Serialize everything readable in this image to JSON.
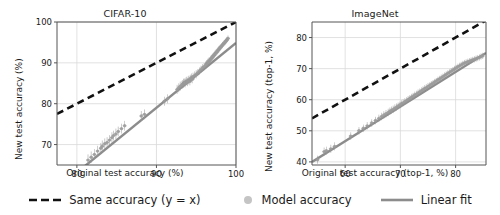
{
  "figure": {
    "background": "#ffffff",
    "scatter_color": "#9a9a9a",
    "fit_color": "#8c8c8c",
    "identity_color": "#111111",
    "grid_color": "#d9d9d9",
    "axis_color": "#555555"
  },
  "legend": {
    "items": [
      {
        "label": "Same accuracy (y = x)",
        "marker": "dashed-line-swatch",
        "color": "#111111"
      },
      {
        "label": "Model accuracy",
        "marker": "circle-marker-swatch",
        "color": "#bdbdbd"
      },
      {
        "label": "Linear fit",
        "marker": "solid-line-swatch",
        "color": "#8c8c8c"
      }
    ]
  },
  "chart_data": [
    {
      "type": "scatter",
      "title": "CIFAR-10",
      "xlabel": "Original test accuracy (%)",
      "ylabel": "New test accuracy (%)",
      "xlim": [
        77.5,
        100.0
      ],
      "ylim": [
        65.0,
        100.0
      ],
      "xticks": [
        80,
        90,
        100
      ],
      "yticks": [
        70,
        80,
        90,
        100
      ],
      "grid": true,
      "legend_position": "figure-bottom",
      "identity_line": {
        "label": "Same accuracy (y = x)",
        "slope": 1,
        "intercept": 0,
        "style": "dashed"
      },
      "linear_fit": {
        "label": "Linear fit",
        "slope": 1.588,
        "intercept": -63.9,
        "style": "solid"
      },
      "points": [
        {
          "x": 81.4,
          "y": 66.2,
          "yerr": 1.4
        },
        {
          "x": 81.8,
          "y": 66.9,
          "yerr": 1.4
        },
        {
          "x": 82.2,
          "y": 67.6,
          "yerr": 1.3
        },
        {
          "x": 82.6,
          "y": 68.4,
          "yerr": 1.3
        },
        {
          "x": 83.0,
          "y": 69.1,
          "yerr": 1.3
        },
        {
          "x": 83.2,
          "y": 69.6,
          "yerr": 1.4
        },
        {
          "x": 83.5,
          "y": 70.2,
          "yerr": 1.3
        },
        {
          "x": 83.8,
          "y": 70.5,
          "yerr": 1.3
        },
        {
          "x": 84.1,
          "y": 71.1,
          "yerr": 1.2
        },
        {
          "x": 84.4,
          "y": 71.7,
          "yerr": 1.3
        },
        {
          "x": 84.6,
          "y": 72.2,
          "yerr": 1.2
        },
        {
          "x": 84.9,
          "y": 72.6,
          "yerr": 1.3
        },
        {
          "x": 85.2,
          "y": 73.2,
          "yerr": 1.2
        },
        {
          "x": 85.6,
          "y": 73.9,
          "yerr": 1.2
        },
        {
          "x": 86.0,
          "y": 74.6,
          "yerr": 1.2
        },
        {
          "x": 88.1,
          "y": 77.0,
          "yerr": 1.2
        },
        {
          "x": 88.5,
          "y": 77.4,
          "yerr": 1.2
        },
        {
          "x": 91.0,
          "y": 80.6,
          "yerr": 1.1
        },
        {
          "x": 91.4,
          "y": 81.2,
          "yerr": 1.1
        },
        {
          "x": 92.6,
          "y": 83.5,
          "yerr": 1.1
        },
        {
          "x": 92.8,
          "y": 83.9,
          "yerr": 1.1
        },
        {
          "x": 93.0,
          "y": 84.3,
          "yerr": 1.1
        },
        {
          "x": 93.2,
          "y": 84.6,
          "yerr": 1.0
        },
        {
          "x": 93.3,
          "y": 84.8,
          "yerr": 1.0
        },
        {
          "x": 93.4,
          "y": 85.0,
          "yerr": 1.1
        },
        {
          "x": 93.5,
          "y": 85.2,
          "yerr": 1.0
        },
        {
          "x": 93.6,
          "y": 85.0,
          "yerr": 1.0
        },
        {
          "x": 93.7,
          "y": 85.4,
          "yerr": 1.0
        },
        {
          "x": 93.8,
          "y": 85.6,
          "yerr": 1.0
        },
        {
          "x": 93.9,
          "y": 85.3,
          "yerr": 1.0
        },
        {
          "x": 94.0,
          "y": 85.7,
          "yerr": 1.0
        },
        {
          "x": 94.1,
          "y": 85.9,
          "yerr": 1.0
        },
        {
          "x": 94.2,
          "y": 85.5,
          "yerr": 1.0
        },
        {
          "x": 94.3,
          "y": 86.1,
          "yerr": 1.0
        },
        {
          "x": 94.4,
          "y": 86.4,
          "yerr": 1.0
        },
        {
          "x": 94.5,
          "y": 86.0,
          "yerr": 1.0
        },
        {
          "x": 94.6,
          "y": 86.6,
          "yerr": 1.0
        },
        {
          "x": 94.8,
          "y": 86.9,
          "yerr": 1.0
        },
        {
          "x": 95.0,
          "y": 87.2,
          "yerr": 1.0
        },
        {
          "x": 95.2,
          "y": 87.6,
          "yerr": 0.9
        },
        {
          "x": 95.4,
          "y": 88.0,
          "yerr": 0.9
        },
        {
          "x": 95.6,
          "y": 88.4,
          "yerr": 0.9
        },
        {
          "x": 95.8,
          "y": 88.8,
          "yerr": 0.9
        },
        {
          "x": 96.0,
          "y": 89.1,
          "yerr": 0.9
        },
        {
          "x": 96.2,
          "y": 89.5,
          "yerr": 0.9
        },
        {
          "x": 96.3,
          "y": 89.8,
          "yerr": 0.9
        },
        {
          "x": 96.4,
          "y": 90.0,
          "yerr": 0.9
        },
        {
          "x": 96.5,
          "y": 90.2,
          "yerr": 0.9
        },
        {
          "x": 96.6,
          "y": 90.4,
          "yerr": 0.9
        },
        {
          "x": 96.7,
          "y": 90.6,
          "yerr": 0.8
        },
        {
          "x": 96.8,
          "y": 90.9,
          "yerr": 0.8
        },
        {
          "x": 96.9,
          "y": 91.1,
          "yerr": 0.8
        },
        {
          "x": 97.0,
          "y": 91.3,
          "yerr": 0.8
        },
        {
          "x": 97.1,
          "y": 91.6,
          "yerr": 0.8
        },
        {
          "x": 97.2,
          "y": 91.8,
          "yerr": 0.8
        },
        {
          "x": 97.3,
          "y": 92.0,
          "yerr": 0.8
        },
        {
          "x": 97.4,
          "y": 92.3,
          "yerr": 0.8
        },
        {
          "x": 97.5,
          "y": 92.5,
          "yerr": 0.8
        },
        {
          "x": 97.6,
          "y": 92.7,
          "yerr": 0.8
        },
        {
          "x": 97.7,
          "y": 93.0,
          "yerr": 0.8
        },
        {
          "x": 97.8,
          "y": 93.2,
          "yerr": 0.8
        },
        {
          "x": 97.9,
          "y": 93.4,
          "yerr": 0.8
        },
        {
          "x": 98.0,
          "y": 93.7,
          "yerr": 0.7
        },
        {
          "x": 98.1,
          "y": 93.9,
          "yerr": 0.7
        },
        {
          "x": 98.2,
          "y": 94.1,
          "yerr": 0.7
        },
        {
          "x": 98.3,
          "y": 94.4,
          "yerr": 0.7
        },
        {
          "x": 98.4,
          "y": 94.6,
          "yerr": 0.7
        },
        {
          "x": 98.5,
          "y": 94.8,
          "yerr": 0.7
        },
        {
          "x": 98.6,
          "y": 95.0,
          "yerr": 0.7
        },
        {
          "x": 98.7,
          "y": 95.3,
          "yerr": 0.7
        },
        {
          "x": 98.8,
          "y": 95.5,
          "yerr": 0.7
        },
        {
          "x": 98.9,
          "y": 95.7,
          "yerr": 0.7
        },
        {
          "x": 99.0,
          "y": 96.0,
          "yerr": 0.7
        }
      ]
    },
    {
      "type": "scatter",
      "title": "ImageNet",
      "xlabel": "Original test accuracy (top-1, %)",
      "ylabel": "New test accuracy (top-1, %)",
      "xlim": [
        54.0,
        85.5
      ],
      "ylim": [
        39.0,
        85.0
      ],
      "xticks": [
        60,
        70,
        80
      ],
      "yticks": [
        40,
        50,
        60,
        70,
        80
      ],
      "grid": true,
      "legend_position": "figure-bottom",
      "identity_line": {
        "label": "Same accuracy (y = x)",
        "slope": 1,
        "intercept": 0,
        "style": "dashed"
      },
      "linear_fit": {
        "label": "Linear fit",
        "slope": 1.114,
        "intercept": -20.2,
        "style": "solid"
      },
      "points": [
        {
          "x": 55.0,
          "y": 40.7,
          "yerr": 1.3
        },
        {
          "x": 56.2,
          "y": 43.3,
          "yerr": 1.3
        },
        {
          "x": 56.6,
          "y": 43.6,
          "yerr": 1.3
        },
        {
          "x": 57.4,
          "y": 44.2,
          "yerr": 1.3
        },
        {
          "x": 58.1,
          "y": 45.0,
          "yerr": 1.3
        },
        {
          "x": 61.0,
          "y": 48.3,
          "yerr": 1.2
        },
        {
          "x": 62.5,
          "y": 50.0,
          "yerr": 1.2
        },
        {
          "x": 63.3,
          "y": 50.8,
          "yerr": 1.2
        },
        {
          "x": 64.0,
          "y": 51.6,
          "yerr": 1.2
        },
        {
          "x": 64.8,
          "y": 52.5,
          "yerr": 1.2
        },
        {
          "x": 65.5,
          "y": 53.3,
          "yerr": 1.2
        },
        {
          "x": 66.1,
          "y": 54.0,
          "yerr": 1.2
        },
        {
          "x": 66.6,
          "y": 54.6,
          "yerr": 1.2
        },
        {
          "x": 67.0,
          "y": 55.1,
          "yerr": 1.2
        },
        {
          "x": 67.4,
          "y": 55.5,
          "yerr": 1.2
        },
        {
          "x": 67.8,
          "y": 55.9,
          "yerr": 1.2
        },
        {
          "x": 68.1,
          "y": 56.3,
          "yerr": 1.2
        },
        {
          "x": 68.4,
          "y": 56.6,
          "yerr": 1.2
        },
        {
          "x": 68.7,
          "y": 56.9,
          "yerr": 1.2
        },
        {
          "x": 69.0,
          "y": 57.3,
          "yerr": 1.2
        },
        {
          "x": 69.3,
          "y": 57.6,
          "yerr": 1.2
        },
        {
          "x": 69.6,
          "y": 58.0,
          "yerr": 1.1
        },
        {
          "x": 69.9,
          "y": 58.3,
          "yerr": 1.1
        },
        {
          "x": 70.2,
          "y": 58.7,
          "yerr": 1.1
        },
        {
          "x": 70.5,
          "y": 59.0,
          "yerr": 1.1
        },
        {
          "x": 70.8,
          "y": 59.4,
          "yerr": 1.1
        },
        {
          "x": 71.1,
          "y": 59.7,
          "yerr": 1.1
        },
        {
          "x": 71.4,
          "y": 60.1,
          "yerr": 1.1
        },
        {
          "x": 71.7,
          "y": 60.4,
          "yerr": 1.1
        },
        {
          "x": 72.0,
          "y": 60.8,
          "yerr": 1.1
        },
        {
          "x": 72.3,
          "y": 61.1,
          "yerr": 1.1
        },
        {
          "x": 72.6,
          "y": 61.5,
          "yerr": 1.1
        },
        {
          "x": 72.9,
          "y": 61.8,
          "yerr": 1.1
        },
        {
          "x": 73.2,
          "y": 62.2,
          "yerr": 1.1
        },
        {
          "x": 73.5,
          "y": 62.5,
          "yerr": 1.1
        },
        {
          "x": 73.8,
          "y": 62.9,
          "yerr": 1.1
        },
        {
          "x": 74.1,
          "y": 63.2,
          "yerr": 1.1
        },
        {
          "x": 74.4,
          "y": 63.6,
          "yerr": 1.1
        },
        {
          "x": 74.7,
          "y": 63.9,
          "yerr": 1.1
        },
        {
          "x": 75.0,
          "y": 64.3,
          "yerr": 1.1
        },
        {
          "x": 75.3,
          "y": 64.6,
          "yerr": 1.0
        },
        {
          "x": 75.6,
          "y": 65.0,
          "yerr": 1.0
        },
        {
          "x": 75.9,
          "y": 65.3,
          "yerr": 1.0
        },
        {
          "x": 76.2,
          "y": 65.7,
          "yerr": 1.0
        },
        {
          "x": 76.5,
          "y": 66.0,
          "yerr": 1.0
        },
        {
          "x": 76.8,
          "y": 66.4,
          "yerr": 1.0
        },
        {
          "x": 77.1,
          "y": 66.7,
          "yerr": 1.0
        },
        {
          "x": 77.4,
          "y": 67.1,
          "yerr": 1.0
        },
        {
          "x": 77.7,
          "y": 67.4,
          "yerr": 1.0
        },
        {
          "x": 78.0,
          "y": 67.8,
          "yerr": 1.0
        },
        {
          "x": 78.3,
          "y": 68.1,
          "yerr": 1.0
        },
        {
          "x": 78.6,
          "y": 68.5,
          "yerr": 1.0
        },
        {
          "x": 78.9,
          "y": 68.8,
          "yerr": 1.0
        },
        {
          "x": 79.2,
          "y": 69.2,
          "yerr": 1.0
        },
        {
          "x": 79.5,
          "y": 69.5,
          "yerr": 1.0
        },
        {
          "x": 79.8,
          "y": 69.9,
          "yerr": 1.0
        },
        {
          "x": 80.1,
          "y": 70.2,
          "yerr": 1.0
        },
        {
          "x": 80.4,
          "y": 70.6,
          "yerr": 1.0
        },
        {
          "x": 80.7,
          "y": 70.9,
          "yerr": 1.0
        },
        {
          "x": 81.0,
          "y": 71.2,
          "yerr": 1.0
        },
        {
          "x": 81.3,
          "y": 71.5,
          "yerr": 1.0
        },
        {
          "x": 81.6,
          "y": 71.8,
          "yerr": 1.0
        },
        {
          "x": 81.9,
          "y": 72.0,
          "yerr": 1.0
        },
        {
          "x": 82.2,
          "y": 72.2,
          "yerr": 1.0
        },
        {
          "x": 82.5,
          "y": 72.4,
          "yerr": 1.0
        },
        {
          "x": 82.8,
          "y": 72.6,
          "yerr": 1.0
        },
        {
          "x": 83.1,
          "y": 72.8,
          "yerr": 1.0
        },
        {
          "x": 83.4,
          "y": 73.0,
          "yerr": 1.0
        },
        {
          "x": 83.7,
          "y": 73.2,
          "yerr": 1.0
        },
        {
          "x": 84.0,
          "y": 73.4,
          "yerr": 1.0
        },
        {
          "x": 84.3,
          "y": 73.6,
          "yerr": 1.0
        },
        {
          "x": 84.6,
          "y": 73.9,
          "yerr": 1.0
        },
        {
          "x": 84.9,
          "y": 74.1,
          "yerr": 1.0
        }
      ]
    }
  ]
}
